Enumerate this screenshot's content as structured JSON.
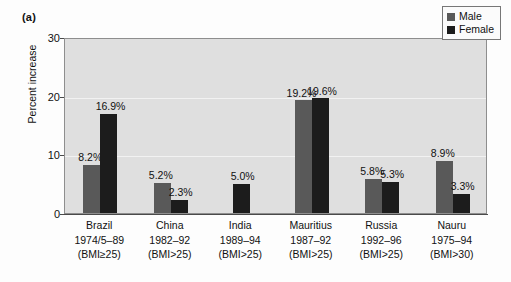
{
  "panel": {
    "label": "(a)"
  },
  "legend": {
    "position": "top-right",
    "entries": [
      {
        "label": "Male",
        "color": "#595959"
      },
      {
        "label": "Female",
        "color": "#1c1c1c"
      }
    ]
  },
  "axes": {
    "ylabel": "Percent increase",
    "yticks": [
      "0",
      "10",
      "20",
      "30"
    ],
    "ymin": 0,
    "ymax": 30
  },
  "chart_data": {
    "type": "bar",
    "title": "",
    "xlabel": "",
    "ylabel": "Percent increase",
    "ylim": [
      0,
      30
    ],
    "yticks": [
      0,
      10,
      20,
      30
    ],
    "grid": true,
    "legend_position": "top-right",
    "categories": [
      "Brazil\n1974/5–89\n(BMI≥25)",
      "China\n1982–92\n(BMI>25)",
      "India\n1989–94\n(BMI>25)",
      "Mauritius\n1987–92\n(BMI>25)",
      "Russia\n1992–96\n(BMI>25)",
      "Nauru\n1975–94\n(BMI>30)"
    ],
    "series": [
      {
        "name": "Male",
        "color": "#595959",
        "values": [
          8.2,
          5.2,
          null,
          19.2,
          5.8,
          8.9
        ]
      },
      {
        "name": "Female",
        "color": "#1c1c1c",
        "values": [
          16.9,
          2.3,
          5.0,
          19.6,
          5.3,
          3.3
        ]
      }
    ],
    "data_labels": {
      "Male": [
        "8.2%",
        "5.2%",
        "",
        "19.2%",
        "5.8%",
        "8.9%"
      ],
      "Female": [
        "16.9%",
        "2.3%",
        "5.0%",
        "19.6%",
        "5.3%",
        "3.3%"
      ]
    }
  },
  "groups": [
    {
      "country": "Brazil",
      "period": "1974/5–89",
      "bmi": "(BMI≥25)",
      "male": {
        "value": 8.2,
        "label": "8.2%"
      },
      "female": {
        "value": 16.9,
        "label": "16.9%"
      }
    },
    {
      "country": "China",
      "period": "1982–92",
      "bmi": "(BMI>25)",
      "male": {
        "value": 5.2,
        "label": "5.2%"
      },
      "female": {
        "value": 2.3,
        "label": "2.3%"
      }
    },
    {
      "country": "India",
      "period": "1989–94",
      "bmi": "(BMI>25)",
      "male": {
        "value": null,
        "label": ""
      },
      "female": {
        "value": 5.0,
        "label": "5.0%"
      }
    },
    {
      "country": "Mauritius",
      "period": "1987–92",
      "bmi": "(BMI>25)",
      "male": {
        "value": 19.2,
        "label": "19.2%"
      },
      "female": {
        "value": 19.6,
        "label": "19.6%"
      }
    },
    {
      "country": "Russia",
      "period": "1992–96",
      "bmi": "(BMI>25)",
      "male": {
        "value": 5.8,
        "label": "5.8%"
      },
      "female": {
        "value": 5.3,
        "label": "5.3%"
      }
    },
    {
      "country": "Nauru",
      "period": "1975–94",
      "bmi": "(BMI>30)",
      "male": {
        "value": 8.9,
        "label": "8.9%"
      },
      "female": {
        "value": 3.3,
        "label": "3.3%"
      }
    }
  ]
}
